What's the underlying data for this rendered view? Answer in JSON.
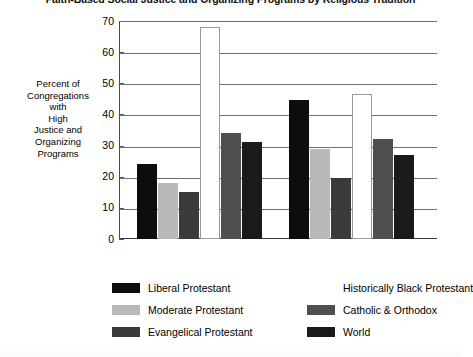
{
  "chart_data": {
    "type": "bar",
    "title": "Faith-Based Social Justice and Organizing Programs by Religious Tradition",
    "xlabel": "",
    "ylabel": "Percent of Congregations with High Justice and Organizing Programs",
    "ylabel_lines": [
      "Percent of",
      "Congregations",
      "with",
      "High",
      "Justice and",
      "Organizing",
      "Programs"
    ],
    "ylim": [
      0,
      70
    ],
    "ytick_labels": [
      "70",
      "60",
      "50",
      "40",
      "30",
      "20",
      "10",
      "0"
    ],
    "ytick_values": [
      70,
      60,
      50,
      40,
      30,
      20,
      10,
      0
    ],
    "grid": true,
    "legend_position": "bottom",
    "categories": [
      "Group 1",
      "Group 2"
    ],
    "series": [
      {
        "name": "Liberal Protestant",
        "color": "#0d0d0d",
        "values": [
          24.0,
          44.5
        ]
      },
      {
        "name": "Moderate Protestant",
        "color": "#b9b9b9",
        "values": [
          18.0,
          29.0
        ]
      },
      {
        "name": "Evangelical Protestant",
        "color": "#3a3a3a",
        "values": [
          15.0,
          19.5
        ]
      },
      {
        "name": "Historically Black Protestant",
        "color": "#ffffff",
        "values": [
          68.0,
          46.5
        ]
      },
      {
        "name": "Catholic & Orthodox",
        "color": "#4f4f4f",
        "values": [
          34.0,
          32.0
        ]
      },
      {
        "name": "World",
        "color": "#1a1a1a",
        "values": [
          31.0,
          27.0
        ]
      }
    ]
  },
  "legend": {
    "entries": [
      {
        "label": "Liberal Protestant",
        "color": "#0d0d0d"
      },
      {
        "label": "Moderate Protestant",
        "color": "#b9b9b9"
      },
      {
        "label": "Evangelical Protestant",
        "color": "#3a3a3a"
      },
      {
        "label": "Historically Black Protestant",
        "color": "#ffffff"
      },
      {
        "label": "Catholic & Orthodox",
        "color": "#4f4f4f"
      },
      {
        "label": "World",
        "color": "#1a1a1a"
      }
    ]
  }
}
